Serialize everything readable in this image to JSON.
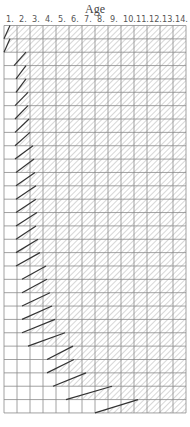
{
  "chart_data": {
    "type": "diagram",
    "title": "Age",
    "column_labels": [
      "1.",
      "2.",
      "3.",
      "4.",
      "5.",
      "6.",
      "7.",
      "8.",
      "9.",
      "10.",
      "11.",
      "12.",
      "13.",
      "14."
    ],
    "grid": {
      "left": 4,
      "top": 25.5,
      "col_width": 13,
      "row_height": 13.36,
      "cols": 14,
      "rows": 29
    },
    "rows": [
      {
        "start": 4,
        "end": 10
      },
      {
        "start": 4,
        "end": 10
      },
      {
        "start": 14,
        "end": 26
      },
      {
        "start": 16,
        "end": 26
      },
      {
        "start": 16,
        "end": 26
      },
      {
        "start": 15,
        "end": 28
      },
      {
        "start": 15,
        "end": 28
      },
      {
        "start": 15,
        "end": 29
      },
      {
        "start": 15,
        "end": 30
      },
      {
        "start": 15,
        "end": 33
      },
      {
        "start": 16,
        "end": 34
      },
      {
        "start": 16,
        "end": 35
      },
      {
        "start": 16,
        "end": 36
      },
      {
        "start": 16,
        "end": 36
      },
      {
        "start": 16,
        "end": 37
      },
      {
        "start": 16,
        "end": 36
      },
      {
        "start": 16,
        "end": 38
      },
      {
        "start": 16,
        "end": 40
      },
      {
        "start": 22,
        "end": 46
      },
      {
        "start": 22,
        "end": 47
      },
      {
        "start": 22,
        "end": 50
      },
      {
        "start": 22,
        "end": 52
      },
      {
        "start": 22,
        "end": 55
      },
      {
        "start": 28,
        "end": 65
      },
      {
        "start": 47,
        "end": 73
      },
      {
        "start": 47,
        "end": 74
      },
      {
        "start": 53,
        "end": 86
      },
      {
        "start": 66,
        "end": 112
      },
      {
        "start": 95,
        "end": 138
      }
    ]
  },
  "colors": {
    "grid_line": "#8a8a8a",
    "hatch": "#b0b0b0",
    "diagonal": "#333333"
  }
}
